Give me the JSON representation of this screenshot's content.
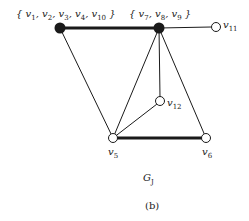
{
  "graph": {
    "name": "G_J",
    "caption_main": "G",
    "caption_sub": "J",
    "panel_label": "(b)",
    "nodes": [
      {
        "id": "A",
        "label": "{ v1, v2, v3, v4, v10 }",
        "filled": true
      },
      {
        "id": "B",
        "label": "{ v7, v8, v9 }",
        "filled": true
      },
      {
        "id": "v11",
        "label": "v11",
        "filled": false
      },
      {
        "id": "v12",
        "label": "v12",
        "filled": false
      },
      {
        "id": "v5",
        "label": "v5",
        "filled": false
      },
      {
        "id": "v6",
        "label": "v6",
        "filled": false
      }
    ],
    "edges": [
      {
        "from": "A",
        "to": "B",
        "bold": true
      },
      {
        "from": "B",
        "to": "v11",
        "bold": false
      },
      {
        "from": "A",
        "to": "v5",
        "bold": false
      },
      {
        "from": "B",
        "to": "v5",
        "bold": false
      },
      {
        "from": "B",
        "to": "v12",
        "bold": false
      },
      {
        "from": "B",
        "to": "v6",
        "bold": false
      },
      {
        "from": "v12",
        "to": "v5",
        "bold": false
      },
      {
        "from": "v5",
        "to": "v6",
        "bold": true
      }
    ]
  },
  "labels": {
    "A": {
      "open": "{ ",
      "items": [
        "v",
        "1",
        ", v",
        "2",
        ", v",
        "3",
        ", v",
        "4",
        ", v",
        "10"
      ],
      "close": " }"
    },
    "B": {
      "open": "{ ",
      "items": [
        "v",
        "7",
        ", v",
        "8",
        ", v",
        "9"
      ],
      "close": " }"
    },
    "v11": {
      "base": "v",
      "sub": "11"
    },
    "v12": {
      "base": "v",
      "sub": "12"
    },
    "v5": {
      "base": "v",
      "sub": "5"
    },
    "v6": {
      "base": "v",
      "sub": "6"
    }
  },
  "colors": {
    "line": "#1a1a1a",
    "background": "#ffffff"
  }
}
